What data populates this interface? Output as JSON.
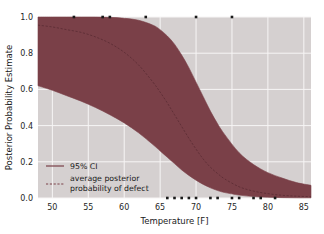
{
  "chart_data": {
    "type": "area",
    "title": "",
    "xlabel": "Temperature [F]",
    "ylabel": "Posterior Probability Estimate",
    "xlim": [
      48,
      86
    ],
    "ylim": [
      0.0,
      1.0
    ],
    "grid": true,
    "xticks": [
      50,
      55,
      60,
      65,
      70,
      75,
      80,
      85
    ],
    "xticklabels": [
      "50",
      "55",
      "60",
      "65",
      "70",
      "75",
      "80",
      "85"
    ],
    "yticks": [
      0.0,
      0.2,
      0.4,
      0.6,
      0.8,
      1.0
    ],
    "yticklabels": [
      "0.0",
      "0.2",
      "0.4",
      "0.6",
      "0.8",
      "1.0"
    ],
    "legend_position": "lower left",
    "legend": [
      {
        "label": "95% CI",
        "style": "solid",
        "color": "#7a4048"
      },
      {
        "label": "average posterior",
        "style": "dashed",
        "color": "#7a4048"
      },
      {
        "label": "probability of defect",
        "style": "none",
        "color": "#7a4048"
      }
    ],
    "band_color": "#7a4048",
    "median_color": "#5e2e35",
    "marker_color": "#1a1a1a",
    "plot_bgcolor": "#d5d0d0",
    "grid_color": "#f7f5f5",
    "series": [
      {
        "name": "95% CI upper",
        "x": [
          48,
          50,
          52,
          54,
          56,
          58,
          60,
          62,
          64,
          65,
          66,
          67,
          68,
          69,
          70,
          71,
          72,
          73,
          74,
          76,
          78,
          80,
          82,
          84,
          86
        ],
        "values": [
          1.0,
          1.0,
          1.0,
          1.0,
          1.0,
          0.998,
          0.993,
          0.982,
          0.955,
          0.93,
          0.895,
          0.85,
          0.79,
          0.72,
          0.64,
          0.56,
          0.48,
          0.41,
          0.35,
          0.25,
          0.185,
          0.14,
          0.11,
          0.085,
          0.07
        ]
      },
      {
        "name": "average posterior probability of defect",
        "x": [
          48,
          50,
          52,
          54,
          56,
          58,
          60,
          62,
          64,
          65,
          66,
          67,
          68,
          69,
          70,
          71,
          72,
          73,
          74,
          76,
          78,
          80,
          82,
          84,
          86
        ],
        "values": [
          0.955,
          0.945,
          0.93,
          0.915,
          0.89,
          0.855,
          0.805,
          0.735,
          0.64,
          0.585,
          0.525,
          0.46,
          0.395,
          0.33,
          0.27,
          0.215,
          0.17,
          0.135,
          0.105,
          0.062,
          0.038,
          0.024,
          0.015,
          0.01,
          0.007
        ]
      },
      {
        "name": "95% CI lower",
        "x": [
          48,
          50,
          52,
          54,
          56,
          58,
          60,
          62,
          64,
          65,
          66,
          67,
          68,
          69,
          70,
          71,
          72,
          73,
          74,
          76,
          78,
          80,
          82,
          84,
          86
        ],
        "values": [
          0.62,
          0.595,
          0.565,
          0.535,
          0.5,
          0.46,
          0.415,
          0.36,
          0.295,
          0.26,
          0.225,
          0.19,
          0.155,
          0.125,
          0.098,
          0.075,
          0.056,
          0.041,
          0.03,
          0.016,
          0.008,
          0.004,
          0.002,
          0.001,
          0.001
        ]
      }
    ],
    "scatter": {
      "name": "observed defects",
      "marker": "square",
      "points": [
        {
          "x": 53,
          "y": 1.0
        },
        {
          "x": 57,
          "y": 1.0
        },
        {
          "x": 58,
          "y": 1.0
        },
        {
          "x": 63,
          "y": 1.0
        },
        {
          "x": 70,
          "y": 1.0
        },
        {
          "x": 75,
          "y": 1.0
        },
        {
          "x": 66,
          "y": 0.0
        },
        {
          "x": 67,
          "y": 0.0
        },
        {
          "x": 68,
          "y": 0.0
        },
        {
          "x": 69,
          "y": 0.0
        },
        {
          "x": 70,
          "y": 0.0
        },
        {
          "x": 72,
          "y": 0.0
        },
        {
          "x": 73,
          "y": 0.0
        },
        {
          "x": 75,
          "y": 0.0
        },
        {
          "x": 76,
          "y": 0.0
        },
        {
          "x": 78,
          "y": 0.0
        },
        {
          "x": 79,
          "y": 0.0
        },
        {
          "x": 81,
          "y": 0.0
        }
      ]
    }
  }
}
